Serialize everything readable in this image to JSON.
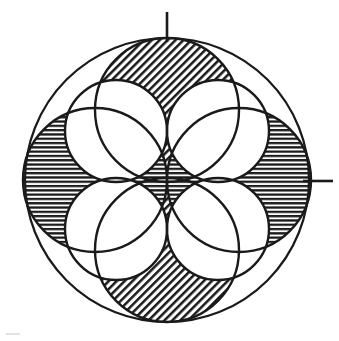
{
  "figure": {
    "canvas": {
      "width": 339,
      "height": 341,
      "background": "#ffffff"
    },
    "ink_color": "#1a1a1a",
    "paper_color": "#ffffff"
  },
  "chart_data": {
    "type": "diagram",
    "center": {
      "x": 167,
      "y": 180
    },
    "outer_circle": {
      "name": "outer-boundary-circle",
      "cx": 167,
      "cy": 180,
      "r": 142,
      "fill": "none",
      "stroke": "#1a1a1a",
      "stroke_width": 2.2
    },
    "large_circles": [
      {
        "name": "top-circle",
        "cx": 167,
        "cy": 110,
        "r": 72,
        "pattern": "diagonal-hatch",
        "label": "Top"
      },
      {
        "name": "right-circle",
        "cx": 239,
        "cy": 180,
        "r": 72,
        "pattern": "horizontal-lines",
        "label": "Right"
      },
      {
        "name": "bottom-circle",
        "cx": 167,
        "cy": 250,
        "r": 72,
        "pattern": "diagonal-hatch",
        "label": "Bottom"
      },
      {
        "name": "left-circle",
        "cx": 95,
        "cy": 180,
        "r": 72,
        "pattern": "horizontal-lines",
        "label": "Left"
      }
    ],
    "diagonal_circles": [
      {
        "name": "upper-right-circle",
        "cx": 218,
        "cy": 131,
        "r": 51,
        "pattern": "none",
        "label": "Upper right"
      },
      {
        "name": "lower-right-circle",
        "cx": 218,
        "cy": 229,
        "r": 51,
        "pattern": "none",
        "label": "Lower right"
      },
      {
        "name": "lower-left-circle",
        "cx": 116,
        "cy": 229,
        "r": 51,
        "pattern": "none",
        "label": "Lower left"
      },
      {
        "name": "upper-left-circle",
        "cx": 116,
        "cy": 131,
        "r": 51,
        "pattern": "none",
        "label": "Upper left"
      }
    ],
    "patterns": {
      "diagonal-hatch": {
        "angle_deg": -45,
        "spacing_px": 4,
        "stroke": "#1a1a1a",
        "stroke_width": 1.6
      },
      "horizontal-lines": {
        "angle_deg": 0,
        "spacing_px": 4,
        "stroke": "#1a1a1a",
        "stroke_width": 1.7
      },
      "cross-hatch": {
        "description": "Overlap of diagonal and horizontal patterns, appears dark",
        "stroke": "#1a1a1a"
      }
    },
    "tick_marks": [
      {
        "name": "top-tick",
        "orientation": "vertical",
        "x1": 167,
        "y1": 12,
        "x2": 167,
        "y2": 42
      },
      {
        "name": "right-tick",
        "orientation": "horizontal",
        "x1": 303,
        "y1": 181,
        "x2": 333,
        "y2": 181
      }
    ],
    "notes": [
      "Four large circles meet at the common centre point.",
      "Overlap lenses between neighbouring large circles read as dense cross-hatch.",
      "The four diagonal circles are unshaded and carve the white petal rosette at the centre."
    ]
  }
}
